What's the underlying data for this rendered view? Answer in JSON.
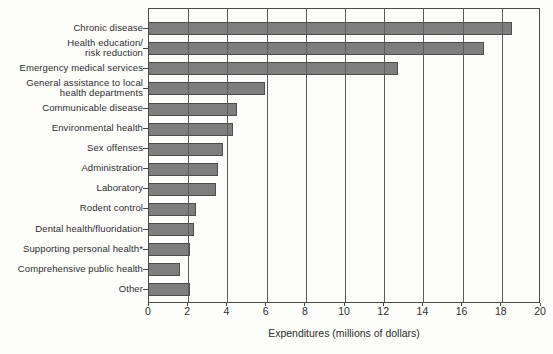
{
  "chart_data": {
    "type": "bar",
    "orientation": "horizontal",
    "title": "",
    "xlabel": "Expenditures (millions of dollars)",
    "ylabel": "",
    "xlim": [
      0,
      20
    ],
    "xticks": [
      0,
      2,
      4,
      6,
      8,
      10,
      12,
      14,
      16,
      18,
      20
    ],
    "grid": "vertical gridlines at every x tick, drawn over the bars",
    "legend_position": "none",
    "categories": [
      "Chronic disease",
      "Health education/\nrisk reduction",
      "Emergency medical services",
      "General assistance to local\nhealth departments",
      "Communicable disease",
      "Environmental health",
      "Sex offenses",
      "Administration",
      "Laboratory",
      "Rodent control",
      "Dental health/fluoridation",
      "Supporting personal health*",
      "Comprehensive public health",
      "Other"
    ],
    "values": [
      18.5,
      17.1,
      12.7,
      5.9,
      4.5,
      4.3,
      3.8,
      3.5,
      3.4,
      2.4,
      2.3,
      2.1,
      1.6,
      2.1
    ]
  },
  "colors": {
    "bar_fill": "#7e7e7e",
    "bar_border": "#4d4d4d",
    "gridline": "#5c5c5c",
    "axis": "#4a4a4a",
    "text": "#2e2e2e",
    "background": "#fdfdfc"
  }
}
